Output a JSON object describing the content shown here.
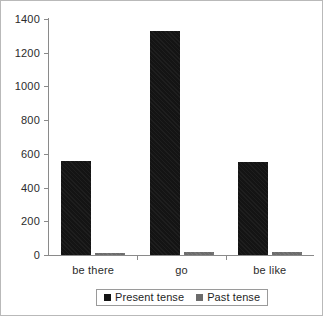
{
  "chart_data": {
    "type": "bar",
    "title": "",
    "subtitle": "",
    "xlabel": "",
    "ylabel": "",
    "categories": [
      "be there",
      "go",
      "be like"
    ],
    "series": [
      {
        "name": "Present tense",
        "color": "#141414",
        "values": [
          560,
          1330,
          550
        ]
      },
      {
        "name": "Past tense",
        "color": "#6c6c6c",
        "values": [
          12,
          18,
          20
        ]
      }
    ],
    "ylim": [
      0,
      1400
    ],
    "y_ticks": [
      0,
      200,
      400,
      600,
      800,
      1000,
      1200,
      1400
    ],
    "y_tick_labels": [
      "0",
      "200",
      "400",
      "600",
      "800",
      "1000",
      "1200",
      "1400"
    ],
    "grid": false,
    "legend_position": "bottom",
    "legend_entries": [
      "Present tense",
      "Past tense"
    ],
    "annotations": []
  },
  "axis": {
    "y_labels": [
      "1400",
      "1200",
      "1000",
      "800",
      "600",
      "400",
      "200",
      "0"
    ],
    "x_labels": [
      "be there",
      "go",
      "be like"
    ]
  },
  "legend": {
    "items": [
      {
        "label": "Present tense",
        "swatch": "present"
      },
      {
        "label": "Past tense",
        "swatch": "past"
      }
    ]
  }
}
